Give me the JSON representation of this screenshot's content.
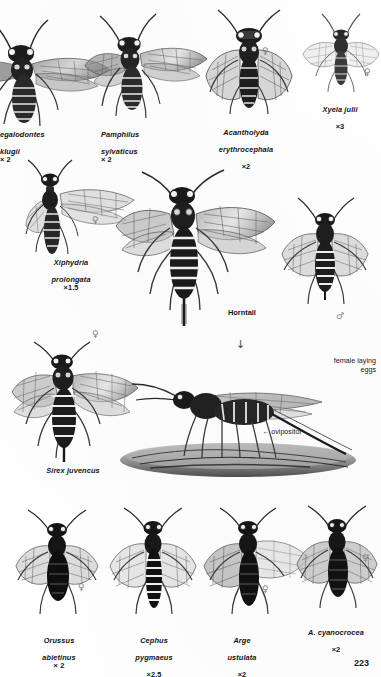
{
  "page": {
    "number": "223",
    "kind": "book-plate",
    "background_color": "#fefefe",
    "ink_color": "#141414",
    "symbol_color": "#7c7c7c"
  },
  "symbols": {
    "female": "♀",
    "male": "♂",
    "arrow_down": "↓",
    "arrow_left": "←"
  },
  "figures": [
    {
      "id": "megalodontes-klugii",
      "species_line1": "egalodontes",
      "species_line2": "klugii",
      "magnification": "× 2",
      "caption_align": "left",
      "cropped_at_left_edge": true,
      "sex": null
    },
    {
      "id": "pamphilus-sylvaticus",
      "species_line1": "Pamphilus",
      "species_line2": "sylvaticus",
      "magnification": "× 2",
      "caption_align": "left",
      "cropped_at_left_edge": false,
      "sex": null
    },
    {
      "id": "acantholyda-erythrocephala",
      "species_line1": "Acantholyda",
      "species_line2": "erythrocephala",
      "magnification": "×2",
      "caption_align": "center",
      "cropped_at_left_edge": false,
      "sex": "♀"
    },
    {
      "id": "xyela-julii",
      "species_line1": "Xyela julii",
      "species_line2": "",
      "magnification": "×3",
      "caption_align": "center",
      "cropped_at_left_edge": false,
      "sex": "♀"
    },
    {
      "id": "xiphydria-prolongata",
      "species_line1": "Xiphydria",
      "species_line2": "prolongata",
      "magnification": "×1.5",
      "caption_align": "center",
      "cropped_at_left_edge": false,
      "sex": "♀"
    },
    {
      "id": "horntail-female",
      "species_line1": "Horntail",
      "species_line2": "",
      "magnification": "",
      "caption_align": "left",
      "cropped_at_left_edge": false,
      "sex": null
    },
    {
      "id": "horntail-male",
      "species_line1": "",
      "species_line2": "",
      "magnification": "",
      "caption_align": "center",
      "cropped_at_left_edge": false,
      "sex": "♂"
    },
    {
      "id": "sirex-juvencus",
      "species_line1": "Sirex juvencus",
      "species_line2": "",
      "magnification": "",
      "caption_align": "center",
      "cropped_at_left_edge": false,
      "sex": "♀"
    },
    {
      "id": "female-laying-eggs",
      "species_line1": "",
      "species_line2": "",
      "magnification": "",
      "caption_align": "right",
      "cropped_at_left_edge": false,
      "sex": null
    },
    {
      "id": "orussus-abietinus",
      "species_line1": "Orussus",
      "species_line2": "abietinus",
      "magnification": "× 2",
      "caption_align": "center",
      "cropped_at_left_edge": false,
      "sex": "♀"
    },
    {
      "id": "cephus-pygmaeus",
      "species_line1": "Cephus",
      "species_line2": "pygmaeus",
      "magnification": "×2.5",
      "caption_align": "center",
      "cropped_at_left_edge": false,
      "sex": null
    },
    {
      "id": "arge-ustulata",
      "species_line1": "Arge",
      "species_line2": "ustulata",
      "magnification": "×2",
      "caption_align": "center",
      "cropped_at_left_edge": false,
      "sex": "♀"
    },
    {
      "id": "arge-cyanocrocea",
      "species_line1": "A. cyanocrocea",
      "species_line2": "",
      "magnification": "×2",
      "caption_align": "center",
      "cropped_at_left_edge": false,
      "sex": "♀"
    }
  ],
  "annotations": {
    "female_laying_eggs_line1": "female laying",
    "female_laying_eggs_line2": "eggs",
    "ovipositor_label": "ovipositor",
    "ovipositor_arrow": "←",
    "arrow_down": "↓"
  }
}
